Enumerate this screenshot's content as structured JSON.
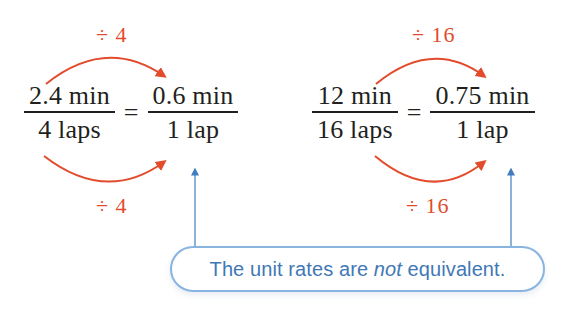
{
  "page": {
    "background_color": "#ffffff",
    "width": 566,
    "height": 310,
    "top_clipped_glyph": "p"
  },
  "colors": {
    "math_text": "#231f20",
    "operation_orange": "#e24b2c",
    "callout_blue": "#3f78b5",
    "callout_border_blue": "#8ab4e0",
    "pointer_blue": "#3f7cc0"
  },
  "equations": [
    {
      "id": "left",
      "left_fraction": {
        "numerator": "2.4 min",
        "denominator": "4 laps"
      },
      "relation": "=",
      "right_fraction": {
        "numerator": "0.6 min",
        "denominator": "1 lap"
      },
      "top_operation": "÷ 4",
      "bottom_operation": "÷ 4"
    },
    {
      "id": "right",
      "left_fraction": {
        "numerator": "12 min",
        "denominator": "16 laps"
      },
      "relation": "=",
      "right_fraction": {
        "numerator": "0.75 min",
        "denominator": "1 lap"
      },
      "top_operation": "÷ 16",
      "bottom_operation": "÷ 16"
    }
  ],
  "callout": {
    "text_before": "The unit rates are ",
    "emphasis": "not",
    "text_after": " equivalent.",
    "full_text": "The unit rates are not equivalent."
  },
  "icons": {
    "curved_arrow": "curved-arrow-icon",
    "up_arrow": "up-arrow-icon"
  }
}
